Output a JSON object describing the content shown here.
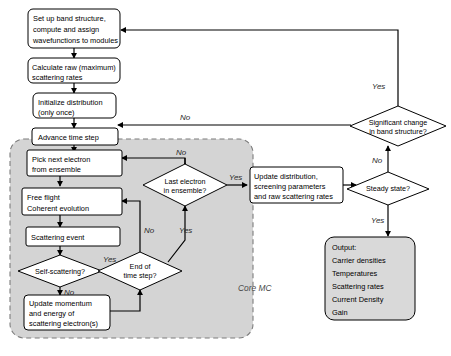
{
  "diagram": {
    "region": {
      "label": "Core MC",
      "fill_color": "#d4d4d4",
      "border_color": "#7d7d7d"
    },
    "nodes": {
      "setup": {
        "type": "process",
        "lines": [
          "Set up band structure,",
          "compute and assign",
          "wavefunctions to modules"
        ]
      },
      "raw_rates": {
        "type": "process",
        "lines": [
          "Calculate raw (maximum)",
          "scattering rates"
        ]
      },
      "init_dist": {
        "type": "process",
        "lines": [
          "Initialize distribution",
          "(only once)"
        ]
      },
      "advance_time": {
        "type": "process",
        "lines": [
          "Advance time step"
        ]
      },
      "pick_electron": {
        "type": "process",
        "lines": [
          "Pick next electron",
          "from ensemble"
        ]
      },
      "free_flight": {
        "type": "process",
        "lines": [
          "Free flight",
          "Coherent evolution"
        ]
      },
      "scattering_event": {
        "type": "process",
        "lines": [
          "Scattering event"
        ]
      },
      "self_scattering": {
        "type": "decision",
        "lines": [
          "Self-scattering?"
        ]
      },
      "end_time_step": {
        "type": "decision",
        "lines": [
          "End of",
          "time step?"
        ]
      },
      "update_momentum": {
        "type": "process",
        "lines": [
          "Update momentum",
          "and energy of",
          "scattering electron(s)"
        ]
      },
      "last_electron": {
        "type": "decision",
        "lines": [
          "Last electron",
          "in ensemble?"
        ]
      },
      "update_distribution": {
        "type": "process",
        "lines": [
          "Update distribution,",
          "screening parameters",
          "and raw scattering rates"
        ]
      },
      "steady_state": {
        "type": "decision",
        "lines": [
          "Steady state?"
        ]
      },
      "significant_change": {
        "type": "decision",
        "lines": [
          "Significant change",
          "in band structure?"
        ]
      },
      "output": {
        "type": "terminal",
        "lines": [
          "Output:",
          "  Carrier densities",
          "  Temperatures",
          "  Scattering rates",
          "  Current Density",
          "  Gain"
        ]
      }
    },
    "edge_labels": {
      "no_top_feedback": "No",
      "yes_band_structure": "Yes",
      "no_band_structure": "No",
      "yes_steady_state": "Yes",
      "no_last_electron": "No",
      "yes_last_electron": "Yes",
      "yes_self_scattering": "Yes",
      "no_self_scattering": "No",
      "no_end_time_step": "No",
      "yes_end_time_step": "Yes"
    }
  }
}
